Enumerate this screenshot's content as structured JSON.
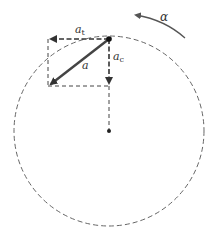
{
  "diagram": {
    "type": "circular-motion-acceleration",
    "labels": {
      "tangential": "a",
      "tangential_sub": "t",
      "centripetal": "a",
      "centripetal_sub": "c",
      "total": "a",
      "angular": "α"
    },
    "colors": {
      "line": "#333333",
      "circle": "#666666",
      "background": "#ffffff"
    }
  }
}
